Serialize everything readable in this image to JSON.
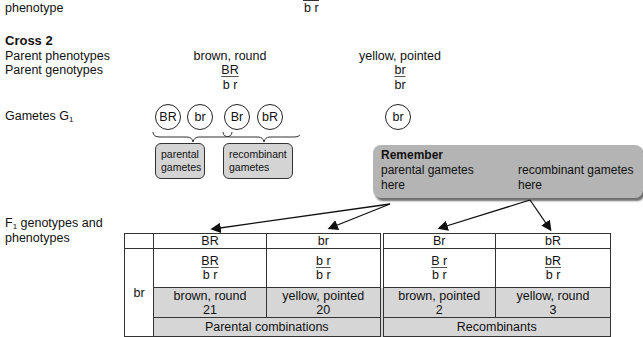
{
  "top_fragment": {
    "label": "phenotype",
    "genotype_bottom": "b r"
  },
  "cross": {
    "title": "Cross 2",
    "rows": {
      "parent_phenotypes_label": "Parent phenotypes",
      "parent_genotypes_label": "Parent genotypes",
      "gametes_label": "Gametes G",
      "gametes_sub": "1"
    },
    "parent1": {
      "phenotype": "brown, round",
      "genotype_top": "BR",
      "genotype_bottom": "b r"
    },
    "parent2": {
      "phenotype": "yellow, pointed",
      "genotype_top": "br",
      "genotype_bottom": "br"
    },
    "gametes_parent1": [
      "BR",
      "br",
      "Br",
      "bR"
    ],
    "gametes_parent2": [
      "br"
    ],
    "gamete_groups": [
      {
        "label_line1": "parental",
        "label_line2": "gametes"
      },
      {
        "label_line1": "recombinant",
        "label_line2": "gametes"
      }
    ]
  },
  "remember": {
    "title": "Remember",
    "left_line1": "parental gametes",
    "left_line2": "here",
    "right_line1": "recombinant gametes",
    "right_line2": "here"
  },
  "f1": {
    "label_prefix": "F",
    "label_sub": "1",
    "label_line1": " genotypes and",
    "label_line2": "phenotypes",
    "row_gamete": "br",
    "columns": [
      {
        "header": "BR",
        "geno_top": "BR",
        "geno_bottom": "b r",
        "phenotype": "brown, round",
        "count": "21"
      },
      {
        "header": "br",
        "geno_top": "b r",
        "geno_bottom": "b r",
        "phenotype": "yellow, pointed",
        "count": "20"
      },
      {
        "header": "Br",
        "geno_top": "B r",
        "geno_bottom": "b r",
        "phenotype": "brown, pointed",
        "count": "2"
      },
      {
        "header": "bR",
        "geno_top": "bR",
        "geno_bottom": "b r",
        "phenotype": "yellow, round",
        "count": "3"
      }
    ],
    "summary_left": "Parental combinations",
    "summary_right": "Recombinants"
  },
  "colors": {
    "cell_shade": "#d6d6d6",
    "remember_bg": "#b4b4b4",
    "label_box_bg": "#d4d4d4"
  }
}
